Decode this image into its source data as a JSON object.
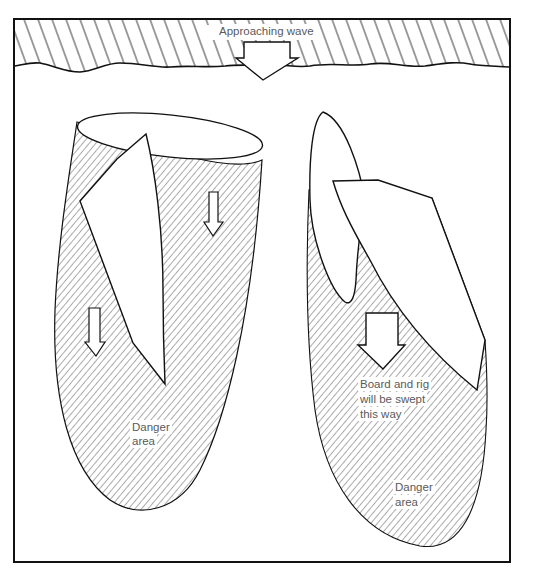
{
  "diagram": {
    "frame": {
      "stroke": "#111111",
      "background": "#ffffff"
    },
    "wave": {
      "label": "Approaching wave",
      "hatch_color": "#333333"
    },
    "left_scenario": {
      "danger_label_line1": "Danger",
      "danger_label_line2": "area",
      "arrows": [
        "down-arrow-right-of-sail",
        "down-arrow-left-of-sail"
      ]
    },
    "right_scenario": {
      "sweep_label_line1": "Board and rig",
      "sweep_label_line2": "will be swept",
      "sweep_label_line3": "this way",
      "danger_label_line1": "Danger",
      "danger_label_line2": "area",
      "arrows": [
        "large-down-arrow"
      ]
    },
    "colors": {
      "line": "#111111",
      "hatch": "#444444",
      "text": "#555555",
      "fill": "#ffffff"
    }
  }
}
